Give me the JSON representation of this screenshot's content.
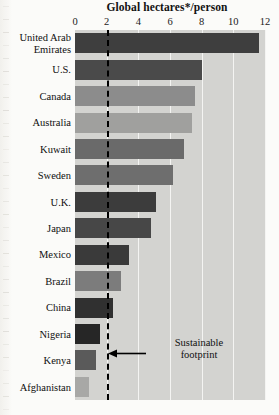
{
  "chart_data": {
    "type": "bar",
    "orientation": "horizontal",
    "title": "Global hectares*/person",
    "xlabel": "Global hectares*/person",
    "ylabel": "",
    "xlim": [
      0,
      12
    ],
    "xticks": [
      0,
      2,
      4,
      6,
      8,
      10,
      12
    ],
    "xtick_labels": [
      "0",
      "2",
      "4",
      "6",
      "8",
      "10",
      "12"
    ],
    "grid": true,
    "legend": null,
    "categories": [
      "United Arab\nEmirates",
      "U.S.",
      "Canada",
      "Australia",
      "Kuwait",
      "Sweden",
      "U.K.",
      "Japan",
      "Mexico",
      "Brazil",
      "China",
      "Nigeria",
      "Kenya",
      "Afghanistan"
    ],
    "values": [
      11.6,
      8.0,
      7.6,
      7.4,
      6.9,
      6.2,
      5.1,
      4.8,
      3.4,
      2.9,
      2.4,
      1.6,
      1.3,
      0.9
    ],
    "bar_colors": [
      "#3e3e3e",
      "#4a4a4a",
      "#8c8c8c",
      "#a0a09e",
      "#6a6a6a",
      "#6e6e6e",
      "#3c3c3c",
      "#474747",
      "#3a3a3a",
      "#7c7c7c",
      "#303030",
      "#262626",
      "#5a5a5a",
      "#a8a8a6"
    ],
    "annotations": [
      {
        "text": "Sustainable\nfootprint",
        "target_value": 2,
        "type": "arrow-label"
      }
    ],
    "reference_line": {
      "value": 2,
      "style": "dashed",
      "color": "#000000",
      "label": "Sustainable footprint"
    },
    "plot_background": "#d3d3d0",
    "gridline_color": "#f4f4f2"
  },
  "annotation": {
    "sustainable_line1": "Sustainable",
    "sustainable_line2": "footprint",
    "full_text": "Sustainable\nfootprint"
  }
}
